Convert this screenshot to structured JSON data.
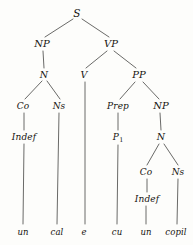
{
  "diagram": {
    "sentence": "un cal e cu un copil",
    "edge_color": "#6a6a68",
    "text_color": "#15130f",
    "background": "#fdfdfb"
  },
  "nodes": [
    {
      "id": "S",
      "label": "S",
      "x": 77,
      "y": 13,
      "size": "lvl-root"
    },
    {
      "id": "NP1",
      "label": "NP",
      "x": 42,
      "y": 44,
      "size": "lvl-phrase"
    },
    {
      "id": "VP",
      "label": "VP",
      "x": 111,
      "y": 44,
      "size": "lvl-phrase"
    },
    {
      "id": "N1",
      "label": "N",
      "x": 44,
      "y": 75,
      "size": "lvl-cat"
    },
    {
      "id": "V",
      "label": "V",
      "x": 84,
      "y": 75,
      "size": "lvl-cat"
    },
    {
      "id": "PP",
      "label": "PP",
      "x": 139,
      "y": 75,
      "size": "lvl-phrase"
    },
    {
      "id": "Co1",
      "label": "Co",
      "x": 23,
      "y": 106,
      "size": "lvl-sub"
    },
    {
      "id": "Ns1",
      "label": "Ns",
      "x": 59,
      "y": 106,
      "size": "lvl-sub"
    },
    {
      "id": "Prep",
      "label": "Prep",
      "x": 118,
      "y": 106,
      "size": "lvl-sub"
    },
    {
      "id": "NP2",
      "label": "NP",
      "x": 161,
      "y": 106,
      "size": "lvl-phrase"
    },
    {
      "id": "Indef1",
      "label": "Indef",
      "x": 24,
      "y": 137,
      "size": "lvl-sub"
    },
    {
      "id": "P1",
      "label": "P",
      "x": 118,
      "y": 137,
      "size": "lvl-sub",
      "subscript": "1"
    },
    {
      "id": "N2",
      "label": "N",
      "x": 161,
      "y": 137,
      "size": "lvl-cat"
    },
    {
      "id": "Co2",
      "label": "Co",
      "x": 146,
      "y": 172,
      "size": "lvl-sub"
    },
    {
      "id": "Ns2",
      "label": "Ns",
      "x": 178,
      "y": 172,
      "size": "lvl-sub"
    },
    {
      "id": "Indef2",
      "label": "Indef",
      "x": 147,
      "y": 199,
      "size": "lvl-sub"
    },
    {
      "id": "w-un1",
      "label": "un",
      "x": 23,
      "y": 232,
      "size": "lvl-word"
    },
    {
      "id": "w-cal",
      "label": "cal",
      "x": 57,
      "y": 232,
      "size": "lvl-word"
    },
    {
      "id": "w-e",
      "label": "e",
      "x": 84,
      "y": 232,
      "size": "lvl-word"
    },
    {
      "id": "w-cu",
      "label": "cu",
      "x": 117,
      "y": 232,
      "size": "lvl-word"
    },
    {
      "id": "w-un2",
      "label": "un",
      "x": 146,
      "y": 232,
      "size": "lvl-word"
    },
    {
      "id": "w-copil",
      "label": "copil",
      "x": 176,
      "y": 232,
      "size": "lvl-word"
    }
  ],
  "edges": [
    {
      "name": "edge-s-np",
      "x1": 73,
      "y1": 19,
      "x2": 45,
      "y2": 37
    },
    {
      "name": "edge-s-vp",
      "x1": 82,
      "y1": 19,
      "x2": 109,
      "y2": 37
    },
    {
      "name": "edge-np1-n1",
      "x1": 43,
      "y1": 51,
      "x2": 44,
      "y2": 68
    },
    {
      "name": "edge-vp-v",
      "x1": 107,
      "y1": 51,
      "x2": 86,
      "y2": 68
    },
    {
      "name": "edge-vp-pp",
      "x1": 114,
      "y1": 51,
      "x2": 136,
      "y2": 68
    },
    {
      "name": "edge-n1-co1",
      "x1": 42,
      "y1": 81,
      "x2": 25,
      "y2": 99
    },
    {
      "name": "edge-n1-ns1",
      "x1": 47,
      "y1": 81,
      "x2": 60,
      "y2": 99
    },
    {
      "name": "edge-v-e",
      "x1": 85,
      "y1": 82,
      "x2": 85,
      "y2": 224
    },
    {
      "name": "edge-pp-prep",
      "x1": 135,
      "y1": 82,
      "x2": 120,
      "y2": 99
    },
    {
      "name": "edge-pp-np2",
      "x1": 143,
      "y1": 82,
      "x2": 159,
      "y2": 99
    },
    {
      "name": "edge-co1-indef1",
      "x1": 24,
      "y1": 113,
      "x2": 24,
      "y2": 130
    },
    {
      "name": "edge-ns1-cal",
      "x1": 59,
      "y1": 113,
      "x2": 57,
      "y2": 224
    },
    {
      "name": "edge-prep-p1",
      "x1": 118,
      "y1": 113,
      "x2": 118,
      "y2": 130
    },
    {
      "name": "edge-np2-n2",
      "x1": 160,
      "y1": 113,
      "x2": 161,
      "y2": 130
    },
    {
      "name": "edge-indef1-un",
      "x1": 24,
      "y1": 144,
      "x2": 23,
      "y2": 224
    },
    {
      "name": "edge-p1-cu",
      "x1": 118,
      "y1": 145,
      "x2": 117,
      "y2": 224
    },
    {
      "name": "edge-n2-co2",
      "x1": 159,
      "y1": 144,
      "x2": 147,
      "y2": 165
    },
    {
      "name": "edge-n2-ns2",
      "x1": 164,
      "y1": 144,
      "x2": 178,
      "y2": 165
    },
    {
      "name": "edge-co2-indef2",
      "x1": 147,
      "y1": 179,
      "x2": 147,
      "y2": 192
    },
    {
      "name": "edge-indef2-un2",
      "x1": 146,
      "y1": 206,
      "x2": 146,
      "y2": 224
    },
    {
      "name": "edge-ns2-copil",
      "x1": 178,
      "y1": 179,
      "x2": 177,
      "y2": 224
    }
  ]
}
